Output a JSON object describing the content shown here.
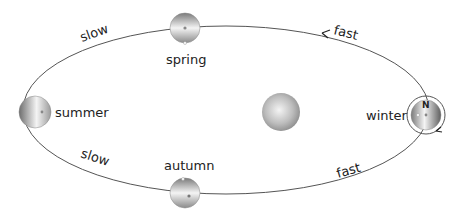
{
  "diagram": {
    "sun": {
      "label": ""
    },
    "positions": {
      "spring": "spring",
      "summer": "summer",
      "autumn": "autumn",
      "winter": "winter"
    },
    "speed_labels": {
      "top_left": "slow",
      "bottom_left": "slow",
      "top_right": "fast",
      "bottom_right": "fast"
    },
    "pole_label": "N",
    "colors": {
      "orbit": "#555555",
      "text": "#222222",
      "planet_dark": "#6e6e6e",
      "planet_light": "#f2f2f2"
    }
  }
}
